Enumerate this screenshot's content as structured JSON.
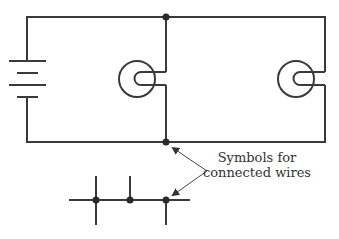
{
  "diagram": {
    "type": "circuit-schematic",
    "components": [
      {
        "name": "battery",
        "kind": "battery",
        "cells": 2
      },
      {
        "name": "bulb-1",
        "kind": "light-bulb"
      },
      {
        "name": "bulb-2",
        "kind": "light-bulb"
      }
    ],
    "junctions": [
      {
        "name": "top-junction",
        "x": 166,
        "y": 17
      },
      {
        "name": "bottom-junction",
        "x": 166,
        "y": 142
      }
    ],
    "annotation": {
      "line1": "Symbols for",
      "line2": "connected wires"
    },
    "colors": {
      "wire": "#3a3a3a",
      "dot": "#2a2a2a",
      "text": "#333333",
      "background": "#ffffff"
    }
  }
}
